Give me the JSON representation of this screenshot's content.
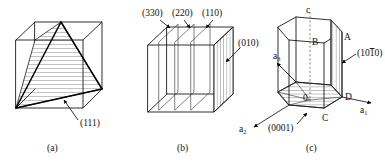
{
  "figure": {
    "background_color": "#ffffff",
    "line_color": "#1a1a1a",
    "panels": [
      {
        "caption": "(a)",
        "kind": "cubic-cell-111-plane",
        "labels": [
          {
            "name": "plane-label-111",
            "text": "(111)"
          }
        ]
      },
      {
        "caption": "(b)",
        "kind": "cubic-cell-family-of-planes",
        "labels": [
          {
            "name": "plane-label-330",
            "text": "(330)"
          },
          {
            "name": "plane-label-220",
            "text": "(220)"
          },
          {
            "name": "plane-label-110",
            "text": "(110)"
          },
          {
            "name": "plane-label-010",
            "text": "(010)"
          }
        ]
      },
      {
        "caption": "(c)",
        "kind": "hexagonal-cell-miller-bravais",
        "labels": [
          {
            "name": "axis-label-c",
            "text": "c"
          },
          {
            "name": "axis-label-a1",
            "text": "a",
            "sub": "1"
          },
          {
            "name": "axis-label-a2",
            "text": "a",
            "sub": "2"
          },
          {
            "name": "axis-label-a3",
            "text": "a",
            "sub": "3"
          },
          {
            "name": "vertex-label-a",
            "text": "A"
          },
          {
            "name": "vertex-label-b",
            "text": "B"
          },
          {
            "name": "vertex-label-c",
            "text": "C"
          },
          {
            "name": "vertex-label-d",
            "text": "D"
          },
          {
            "name": "origin-label",
            "text": "0"
          },
          {
            "name": "plane-label-basal",
            "text": "(0001)"
          },
          {
            "name": "plane-label-prism-prefix",
            "text": "(10"
          },
          {
            "name": "plane-label-prism-bar",
            "text": "1"
          },
          {
            "name": "plane-label-prism-suffix",
            "text": "0)"
          }
        ]
      }
    ]
  },
  "panel_a": {
    "caption": "(a)",
    "plane_label": "(111)"
  },
  "panel_b": {
    "caption": "(b)",
    "label_330": "(330)",
    "label_220": "(220)",
    "label_110": "(110)",
    "label_010": "(010)"
  },
  "panel_c": {
    "caption": "(c)",
    "axis_c": "c",
    "axis_a_letter": "a",
    "axis_a1_sub": "1",
    "axis_a2_sub": "2",
    "axis_a3_sub": "3",
    "vertex_A": "A",
    "vertex_B": "B",
    "vertex_C": "C",
    "vertex_D": "D",
    "origin": "0",
    "label_basal": "(0001)",
    "label_prism_pre": "(10",
    "label_prism_bar": "1",
    "label_prism_post": "0)"
  }
}
